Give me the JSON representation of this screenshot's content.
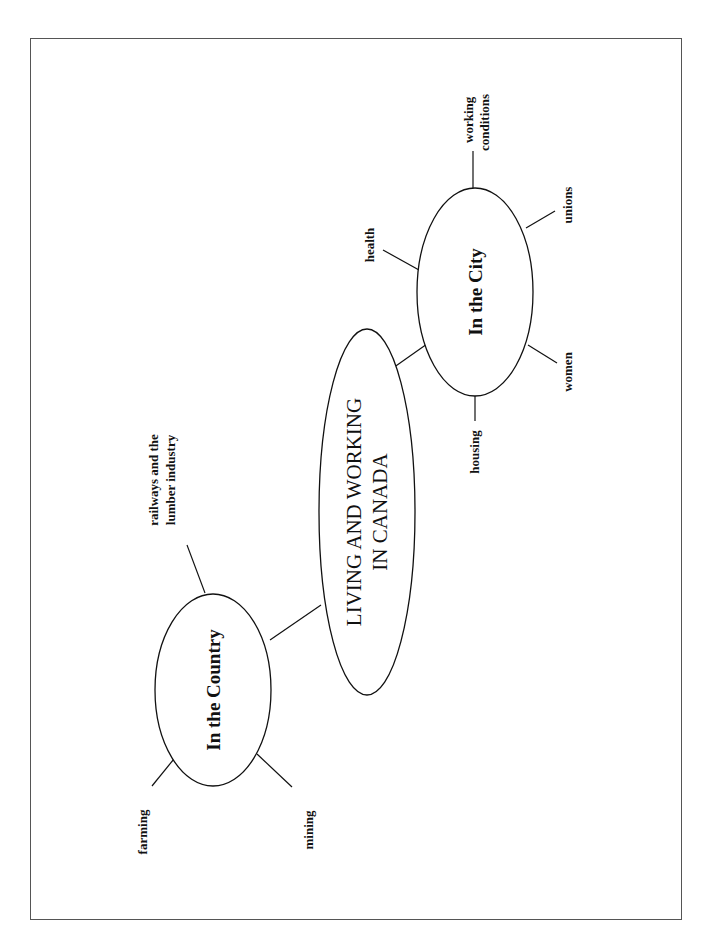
{
  "diagram": {
    "type": "mind-map",
    "orientation": "rotated 90 degrees counter-clockwise",
    "center": {
      "line1": "LIVING AND WORKING",
      "line2": "IN CANADA"
    },
    "branches": [
      {
        "label": "In the City",
        "subtopics": [
          {
            "line1": "working",
            "line2": "conditions"
          },
          {
            "line1": "unions"
          },
          {
            "line1": "women"
          },
          {
            "line1": "housing"
          },
          {
            "line1": "health"
          }
        ]
      },
      {
        "label": "In the Country",
        "subtopics": [
          {
            "line1": "railways and the",
            "line2": "lumber industry"
          },
          {
            "line1": "farming"
          },
          {
            "line1": "mining"
          }
        ]
      }
    ]
  },
  "colors": {
    "ink": "#111111",
    "frame": "#555555",
    "background": "#ffffff"
  }
}
